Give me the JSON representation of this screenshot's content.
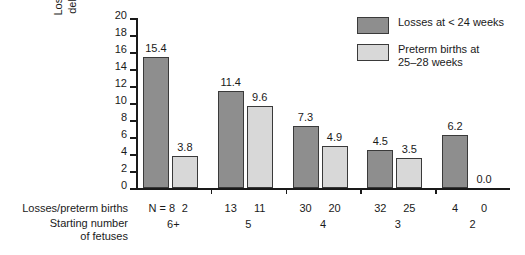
{
  "chart_data": {
    "type": "bar",
    "title": "",
    "subtitle": "",
    "xlabel": "Starting number of fetuses",
    "ylabel": "Losses and preterm deliveries (percent)",
    "ylim": [
      0,
      20
    ],
    "yticks": [
      "0",
      "2",
      "4",
      "6",
      "8",
      "10",
      "12",
      "14",
      "16",
      "18",
      "20"
    ],
    "grid": false,
    "legend_position": "top-right",
    "categories": [
      "6+",
      "5",
      "4",
      "3",
      "2"
    ],
    "series": [
      {
        "name": "Losses at < 24 weeks",
        "color": "#8e8e8e",
        "values": [
          15.4,
          11.4,
          7.3,
          4.5,
          6.2
        ],
        "labels": [
          "15.4",
          "11.4",
          "7.3",
          "4.5",
          "6.2"
        ],
        "counts": [
          "8",
          "13",
          "30",
          "32",
          "4"
        ]
      },
      {
        "name": "Preterm births at 25-28 weeks",
        "color": "#d8d8d8",
        "values": [
          3.8,
          9.6,
          4.9,
          3.5,
          0.0
        ],
        "labels": [
          "3.8",
          "9.6",
          "4.9",
          "3.5",
          "0.0"
        ],
        "counts": [
          "2",
          "11",
          "20",
          "25",
          "0"
        ]
      }
    ],
    "annotations": {
      "counts_row_label": "Losses/preterm births",
      "categories_row_label": "Starting number\nof fetuses",
      "n_prefix": "N ="
    }
  },
  "legend": {
    "items": [
      {
        "label": "Losses at < 24 weeks",
        "swatch": "dark"
      },
      {
        "label": "Preterm births at\n25–28 weeks",
        "swatch": "light"
      }
    ]
  },
  "axis": {
    "y_title_line1": "Losses and preterm",
    "y_title_line2": "deliveries (percent)",
    "y_ticks": [
      "20",
      "18",
      "16",
      "14",
      "12",
      "10",
      "8",
      "6",
      "4",
      "2",
      "0"
    ]
  },
  "bottom_rows": {
    "counts_label": "Losses/preterm births",
    "categories_label": "Starting number\nof fetuses",
    "counts": [
      "N = 8",
      "2",
      "13",
      "11",
      "30",
      "20",
      "32",
      "25",
      "4",
      "0"
    ],
    "categories": [
      "6+",
      "5",
      "4",
      "3",
      "2"
    ]
  },
  "colors": {
    "dark_bar": "#8e8e8e",
    "light_bar": "#d8d8d8",
    "axis": "#1a1a1a",
    "background": "#ffffff"
  }
}
